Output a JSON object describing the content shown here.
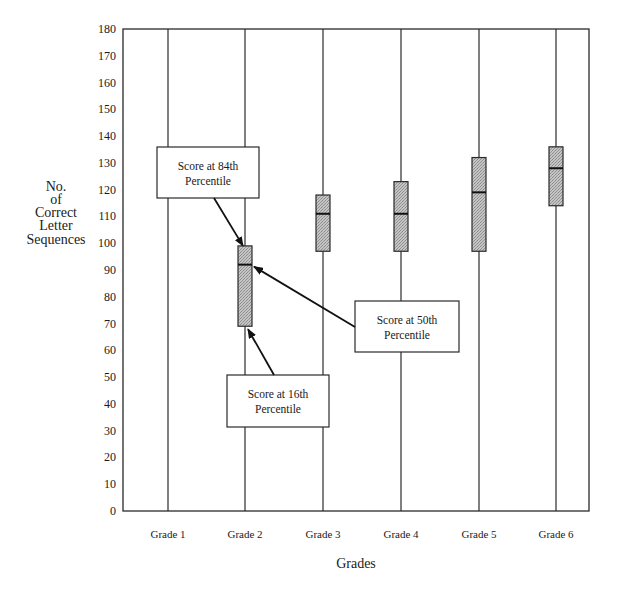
{
  "chart_data": {
    "type": "box",
    "title": "",
    "xlabel": "Grades",
    "ylabel": "No. of Correct Letter Sequences",
    "ylabel_lines": [
      "No.",
      "of",
      "Correct",
      "Letter",
      "Sequences"
    ],
    "ylim": [
      0,
      180
    ],
    "yticks": [
      0,
      10,
      20,
      30,
      40,
      50,
      60,
      70,
      80,
      90,
      100,
      110,
      120,
      130,
      140,
      150,
      160,
      170,
      180
    ],
    "grid": false,
    "legend": null,
    "categories": [
      "Grade 1",
      "Grade 2",
      "Grade 3",
      "Grade 4",
      "Grade 5",
      "Grade 6"
    ],
    "series": [
      {
        "name": "Score at 84th Percentile",
        "values": [
          null,
          99,
          118,
          123,
          132,
          136
        ]
      },
      {
        "name": "Score at 50th Percentile",
        "values": [
          null,
          92,
          111,
          111,
          119,
          128
        ]
      },
      {
        "name": "Score at 16th Percentile",
        "values": [
          null,
          69,
          97,
          97,
          97,
          114
        ]
      }
    ],
    "annotations": [
      {
        "text_lines": [
          "Score at 84th",
          "Percentile"
        ],
        "points_to": "Grade 2 box top (84th percentile)"
      },
      {
        "text_lines": [
          "Score at 50th",
          "Percentile"
        ],
        "points_to": "Grade 2 median line (50th percentile)"
      },
      {
        "text_lines": [
          "Score at 16th",
          "Percentile"
        ],
        "points_to": "Grade 2 box bottom (16th percentile)"
      }
    ],
    "colors": {
      "axis": "#2a2a2a",
      "box_fill": "#b8b8b8",
      "box_stroke": "#2a2a2a",
      "annotation_fill": "#ffffff"
    }
  }
}
